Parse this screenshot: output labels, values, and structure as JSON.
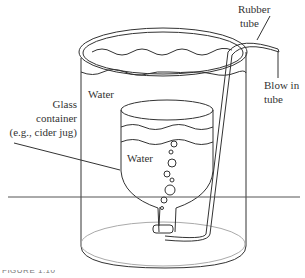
{
  "diagram": {
    "labels": {
      "rubber_tube": [
        "Rubber",
        "tube"
      ],
      "blow_in_tube": [
        "Blow in",
        "tube"
      ],
      "outer_water": "Water",
      "glass_container": [
        "Glass",
        "container",
        "(e.g., cider jug)"
      ],
      "inner_water": "Water"
    },
    "caption": "FIGURE 1.10",
    "colors": {
      "stroke": "#333333",
      "background": "#ffffff",
      "horizon": "#555555"
    }
  }
}
